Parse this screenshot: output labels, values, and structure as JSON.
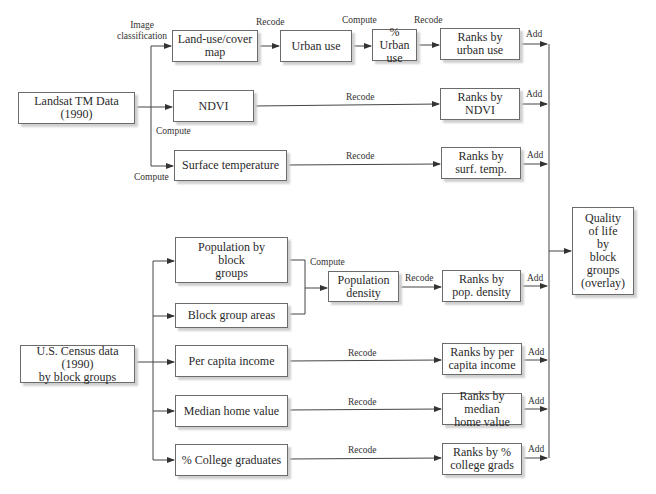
{
  "diagram": {
    "sources": {
      "landsat": "Landsat TM Data (1990)",
      "census": "U.S. Census data (1990)\nby block groups"
    },
    "nodes": {
      "land_use": "Land-use/cover\nmap",
      "urban_use": "Urban use",
      "pct_urban": "% Urban\nuse",
      "ranks_urban": "Ranks by\nurban use",
      "ndvi": "NDVI",
      "ranks_ndvi": "Ranks by\nNDVI",
      "surface_temp": "Surface temperature",
      "ranks_surf": "Ranks by\nsurf. temp.",
      "pop_by_block": "Population by\nblock\ngroups",
      "block_areas": "Block group areas",
      "pop_density": "Population\ndensity",
      "ranks_pop": "Ranks by\npop. density",
      "per_capita": "Per capita income",
      "ranks_per_capita": "Ranks by per\ncapita income",
      "median_home": "Median home value",
      "ranks_median": "Ranks by median\nhome value",
      "college": "% College graduates",
      "ranks_college": "Ranks by %\ncollege grads",
      "quality": "Quality\nof life\nby\nblock\ngroups\n(overlay)"
    },
    "edge_labels": {
      "image_classification": "Image\nclassification",
      "compute": "Compute",
      "recode": "Recode",
      "add": "Add"
    }
  }
}
